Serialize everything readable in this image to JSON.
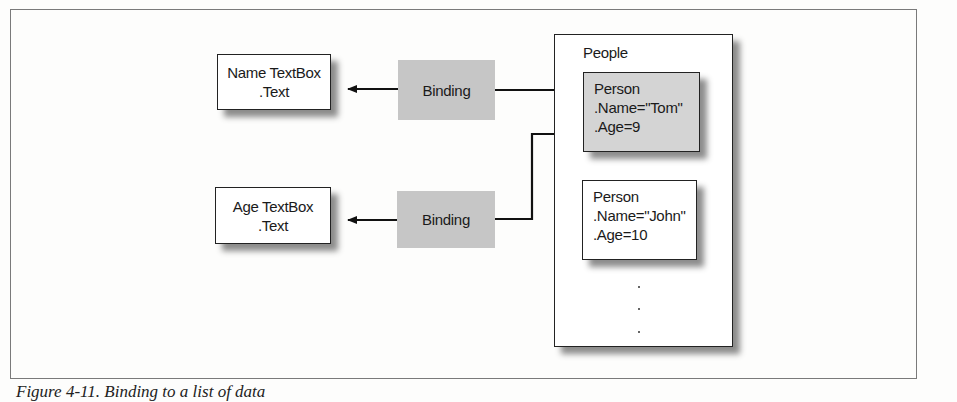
{
  "figure": {
    "caption": "Figure 4-11. Binding to a list of data"
  },
  "sources": [
    {
      "label": "Name TextBox",
      "property": ".Text"
    },
    {
      "label": "Age TextBox",
      "property": ".Text"
    }
  ],
  "bindings": [
    {
      "label": "Binding"
    },
    {
      "label": "Binding"
    }
  ],
  "collection": {
    "title": "People",
    "items": [
      {
        "type": "Person",
        "name": ".Name=\"Tom\"",
        "age": ".Age=9"
      },
      {
        "type": "Person",
        "name": ".Name=\"John\"",
        "age": ".Age=10"
      }
    ],
    "ellipsis": [
      "·",
      "·",
      "·"
    ]
  },
  "colors": {
    "binding_fill": "#c6c6c6",
    "current_item_fill": "#d4d4d4",
    "border": "#222222"
  }
}
